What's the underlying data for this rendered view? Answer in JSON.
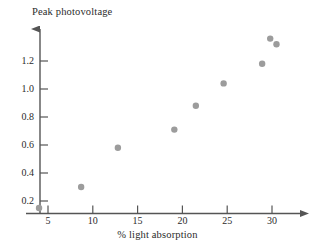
{
  "chart_data": {
    "type": "scatter",
    "title": "",
    "ylabel": "Peak photovoltage",
    "xlabel": "% light absorption",
    "xlim": [
      2.0,
      34.0
    ],
    "ylim": [
      0.0,
      1.45
    ],
    "grid": false,
    "legend": null,
    "point_color": "#9c9c9c",
    "axis_color": "#555555",
    "x_ticks": [
      5,
      10,
      15,
      20,
      25,
      30
    ],
    "x_tick_labels": [
      "5",
      "10",
      "15",
      "20",
      "25",
      "30"
    ],
    "y_ticks": [
      0.2,
      0.4,
      0.6,
      0.8,
      1.0,
      1.2
    ],
    "y_tick_labels": [
      "0.2",
      "0.4",
      "0.6",
      "0.8",
      "1.0",
      "1.2"
    ],
    "points": [
      {
        "x": 4.0,
        "y": 0.15
      },
      {
        "x": 8.7,
        "y": 0.3
      },
      {
        "x": 12.8,
        "y": 0.58
      },
      {
        "x": 19.1,
        "y": 0.71
      },
      {
        "x": 21.5,
        "y": 0.88
      },
      {
        "x": 24.6,
        "y": 1.04
      },
      {
        "x": 28.9,
        "y": 1.18
      },
      {
        "x": 29.8,
        "y": 1.36
      },
      {
        "x": 30.5,
        "y": 1.32
      }
    ]
  }
}
